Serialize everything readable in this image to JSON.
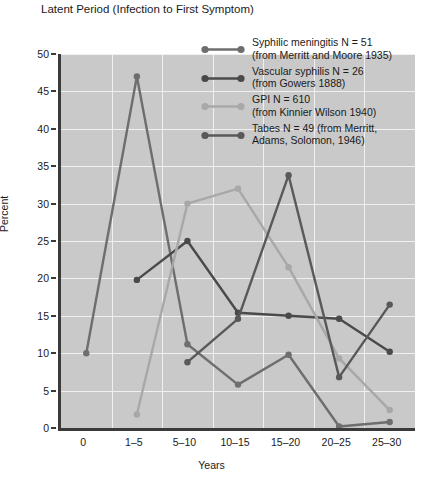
{
  "chart_data": {
    "type": "line",
    "title": "Latent Period (Infection to First Symptom)",
    "xlabel": "Years",
    "ylabel": "Percent",
    "categories": [
      "0",
      "1–5",
      "5–10",
      "10–15",
      "15–20",
      "20–25",
      "25–30"
    ],
    "ylim": [
      0,
      50
    ],
    "yticks": [
      0,
      5,
      10,
      15,
      20,
      25,
      30,
      35,
      40,
      45,
      50
    ],
    "grid": true,
    "legend_position": "top-right",
    "series": [
      {
        "name": "Syphilic meningitis N = 51",
        "source": "(from Merritt and Moore 1935)",
        "color": "#6e6e6e",
        "values": [
          10,
          47,
          11.2,
          5.8,
          9.8,
          0.2,
          0.8
        ]
      },
      {
        "name": "Vascular syphilis N = 26",
        "source": "(from Gowers 1888)",
        "color": "#4a4a4a",
        "values": [
          null,
          19.8,
          25,
          15.4,
          15,
          14.6,
          10.2
        ]
      },
      {
        "name": "GPI N = 610",
        "source": "(from Kinnier Wilson 1940)",
        "color": "#a8a8a8",
        "values": [
          null,
          1.8,
          30,
          32,
          21.5,
          9.3,
          2.4
        ]
      },
      {
        "name": "Tabes N = 49",
        "source": "(from Merritt, Adams, Solomon, 1946)",
        "color": "#595959",
        "values": [
          null,
          null,
          8.8,
          14.6,
          33.8,
          6.8,
          16.5
        ]
      }
    ]
  },
  "legend": {
    "entries": [
      "Syphilic meningitis N = 51\n(from Merritt and Moore 1935)",
      "Vascular syphilis N = 26\n(from Gowers 1888)",
      "GPI N = 610\n(from Kinnier Wilson 1940)",
      "Tabes N = 49 (from Merritt,\nAdams, Solomon, 1946)"
    ]
  }
}
